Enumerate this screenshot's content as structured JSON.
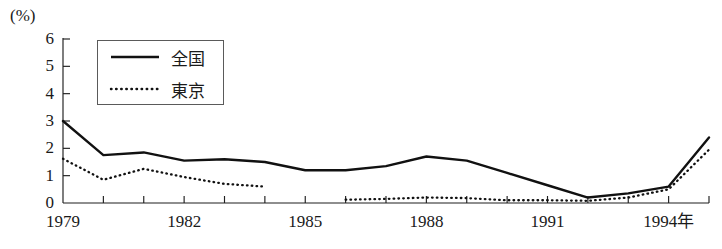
{
  "chart_data": {
    "type": "line",
    "title": "",
    "unit_label": "(%)",
    "xlabel": "",
    "ylabel": "",
    "xlim": [
      1979,
      1995
    ],
    "ylim": [
      0,
      6
    ],
    "grid": false,
    "legend_position": "top-left-inside",
    "y_ticks": [
      "6",
      "5",
      "4",
      "3",
      "2",
      "1",
      "0"
    ],
    "y_tick_values": [
      6,
      5,
      4,
      3,
      2,
      1,
      0
    ],
    "x_ticks": [
      "1979",
      "1982",
      "1985",
      "1988",
      "1991",
      "1994年"
    ],
    "x_tick_values": [
      1979,
      1982,
      1985,
      1988,
      1991,
      1994
    ],
    "x_all_tick_values": [
      1979,
      1980,
      1981,
      1982,
      1983,
      1984,
      1985,
      1986,
      1987,
      1988,
      1989,
      1990,
      1991,
      1992,
      1993,
      1994,
      1995
    ],
    "series": [
      {
        "name": "全国",
        "style": "solid",
        "color": "#111111",
        "x": [
          1979,
          1980,
          1981,
          1982,
          1983,
          1984,
          1985,
          1986,
          1987,
          1988,
          1989,
          1990,
          1991,
          1992,
          1993,
          1994,
          1995
        ],
        "values": [
          3.0,
          1.75,
          1.85,
          1.55,
          1.6,
          1.5,
          1.2,
          1.2,
          1.35,
          1.7,
          1.55,
          1.1,
          0.65,
          0.2,
          0.35,
          0.6,
          2.4
        ]
      },
      {
        "name": "東京",
        "style": "dotted",
        "color": "#111111",
        "x": [
          1979,
          1980,
          1981,
          1982,
          1983,
          1984,
          1986,
          1987,
          1988,
          1989,
          1990,
          1991,
          1992,
          1993,
          1994,
          1995
        ],
        "values": [
          1.62,
          0.85,
          1.25,
          0.95,
          0.7,
          0.6,
          0.12,
          0.15,
          0.2,
          0.18,
          0.1,
          0.1,
          0.08,
          0.2,
          0.5,
          1.95
        ]
      }
    ],
    "series_breaks": {
      "東京": [
        [
          1984,
          1986
        ]
      ]
    },
    "annotations": []
  },
  "legend": {
    "entries": [
      {
        "label": "全国",
        "style": "solid",
        "name": "legend-entry-national"
      },
      {
        "label": "東京",
        "style": "dotted",
        "name": "legend-entry-tokyo"
      }
    ]
  }
}
